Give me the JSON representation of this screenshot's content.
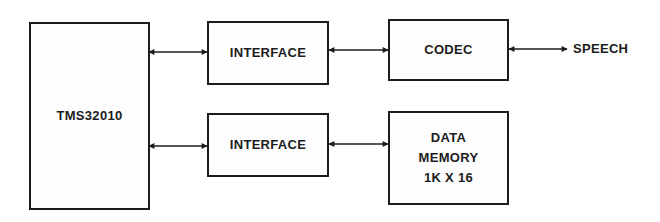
{
  "diagram": {
    "type": "block-diagram",
    "colors": {
      "stroke": "#1c1c1c",
      "background": "#ffffff"
    },
    "blocks": [
      {
        "id": "tms",
        "label": "TMS32010"
      },
      {
        "id": "interface1",
        "label": "INTERFACE"
      },
      {
        "id": "codec",
        "label": "CODEC"
      },
      {
        "id": "interface2",
        "label": "INTERFACE"
      },
      {
        "id": "datamem",
        "lines": [
          "DATA",
          "MEMORY",
          "1K X 16"
        ]
      }
    ],
    "external": {
      "speech": "SPEECH"
    },
    "connections": [
      {
        "from": "tms",
        "to": "interface1",
        "type": "bidirectional"
      },
      {
        "from": "interface1",
        "to": "codec",
        "type": "bidirectional"
      },
      {
        "from": "codec",
        "to": "speech",
        "type": "bidirectional"
      },
      {
        "from": "tms",
        "to": "interface2",
        "type": "bidirectional"
      },
      {
        "from": "interface2",
        "to": "datamem",
        "type": "bidirectional"
      }
    ]
  }
}
